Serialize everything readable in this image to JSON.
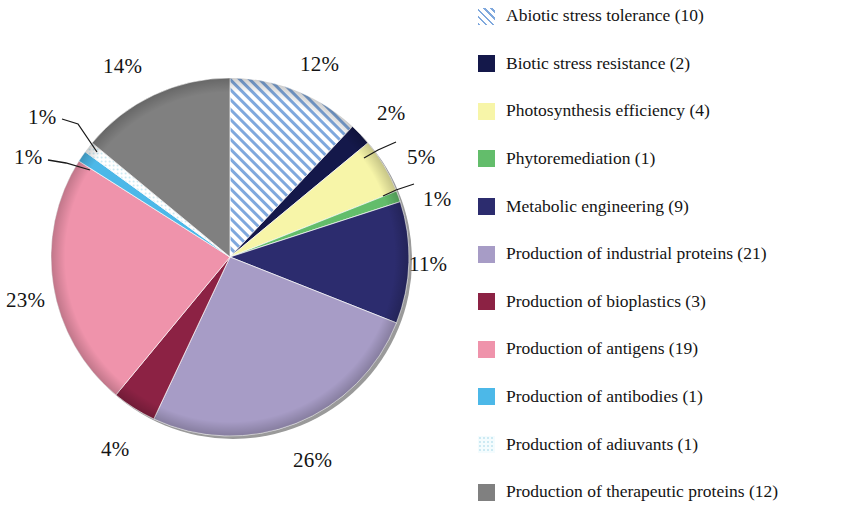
{
  "chart_data": {
    "type": "pie",
    "title": "",
    "subtitle": "",
    "xlabel": "",
    "ylabel": "",
    "legend_position": "right",
    "grid": false,
    "start_angle_deg": 0,
    "direction": "clockwise",
    "categories": [
      "Abiotic stress tolerance",
      "Biotic stress resistance",
      "Photosynthesis efficiency",
      "Phytoremediation",
      "Metabolic engineering",
      "Production of industrial proteins",
      "Production of bioplastics",
      "Production of antigens",
      "Production of antibodies",
      "Production of adiuvants",
      "Production of therapeutic proteins"
    ],
    "values": [
      12,
      2,
      5,
      1,
      11,
      26,
      4,
      23,
      1,
      1,
      14
    ],
    "counts": [
      10,
      2,
      4,
      1,
      9,
      21,
      3,
      19,
      1,
      1,
      12
    ],
    "data_labels": [
      "12%",
      "2%",
      "5%",
      "1%",
      "11%",
      "26%",
      "4%",
      "23%",
      "1%",
      "1%",
      "14%"
    ],
    "colors": [
      "#8fb4e3",
      "#14184a",
      "#f7f5a8",
      "#63bd6b",
      "#2c2c6e",
      "#a79cc6",
      "#8c2244",
      "#ef93ab",
      "#4cb8e8",
      "#eaf7fb",
      "#808080"
    ]
  },
  "slices": [
    {
      "id": "abiotic-stress-tolerance",
      "label": "Abiotic stress tolerance",
      "count": 10,
      "legend_text": "Abiotic stress tolerance (10)",
      "percent_text": "12%",
      "percent": 12,
      "fill": "#8fb4e3",
      "pattern": "diagonal-hatch",
      "label_x": 300,
      "label_y": 52,
      "leader": null
    },
    {
      "id": "biotic-stress-resistance",
      "label": "Biotic stress resistance",
      "count": 2,
      "legend_text": "Biotic stress resistance (2)",
      "percent_text": "2%",
      "percent": 2,
      "fill": "#14184a",
      "pattern": "solid",
      "label_x": 377,
      "label_y": 101,
      "leader": null
    },
    {
      "id": "photosynthesis-efficiency",
      "label": "Photosynthesis efficiency",
      "count": 4,
      "legend_text": "Photosynthesis efficiency (4)",
      "percent_text": "5%",
      "percent": 5,
      "fill": "#f7f5a8",
      "pattern": "solid",
      "label_x": 407,
      "label_y": 145,
      "leader": "5"
    },
    {
      "id": "phytoremediation",
      "label": "Phytoremediation",
      "count": 1,
      "legend_text": "Phytoremediation (1)",
      "percent_text": "1%",
      "percent": 1,
      "fill": "#63bd6b",
      "pattern": "solid",
      "label_x": 423,
      "label_y": 187,
      "leader": "1right"
    },
    {
      "id": "metabolic-engineering",
      "label": "Metabolic engineering",
      "count": 9,
      "legend_text": "Metabolic engineering (9)",
      "percent_text": "11%",
      "percent": 11,
      "fill": "#2c2c6e",
      "pattern": "solid",
      "label_x": 409,
      "label_y": 252,
      "leader": null
    },
    {
      "id": "production-of-industrial-proteins",
      "label": "Production of industrial proteins",
      "count": 21,
      "legend_text": "Production of industrial proteins (21)",
      "percent_text": "26%",
      "percent": 26,
      "fill": "#a79cc6",
      "pattern": "solid",
      "label_x": 293,
      "label_y": 448,
      "leader": null
    },
    {
      "id": "production-of-bioplastics",
      "label": "Production of bioplastics",
      "count": 3,
      "legend_text": "Production of bioplastics (3)",
      "percent_text": "4%",
      "percent": 4,
      "fill": "#8c2244",
      "pattern": "solid",
      "label_x": 101,
      "label_y": 437,
      "leader": null
    },
    {
      "id": "production-of-antigens",
      "label": "Production of antigens",
      "count": 19,
      "legend_text": "Production of antigens (19)",
      "percent_text": "23%",
      "percent": 23,
      "fill": "#ef93ab",
      "pattern": "solid",
      "label_x": 6,
      "label_y": 288,
      "leader": null
    },
    {
      "id": "production-of-antibodies",
      "label": "Production of antibodies",
      "count": 1,
      "legend_text": "Production of antibodies (1)",
      "percent_text": "1%",
      "percent": 1,
      "fill": "#4cb8e8",
      "pattern": "solid",
      "label_x": 14,
      "label_y": 145,
      "leader": "1lower"
    },
    {
      "id": "production-of-adiuvants",
      "label": "Production of adiuvants",
      "count": 1,
      "legend_text": "Production of adiuvants (1)",
      "percent_text": "1%",
      "percent": 1,
      "fill": "#eaf7fb",
      "pattern": "dotted",
      "label_x": 28,
      "label_y": 105,
      "leader": "1upper"
    },
    {
      "id": "production-of-therapeutic-proteins",
      "label": "Production of therapeutic proteins",
      "count": 12,
      "legend_text": "Production of therapeutic proteins (12)",
      "percent_text": "14%",
      "percent": 14,
      "fill": "#808080",
      "pattern": "solid",
      "label_x": 103,
      "label_y": 54,
      "leader": null
    }
  ],
  "geometry": {
    "center_x": 230,
    "center_y": 257,
    "radius": 179
  }
}
